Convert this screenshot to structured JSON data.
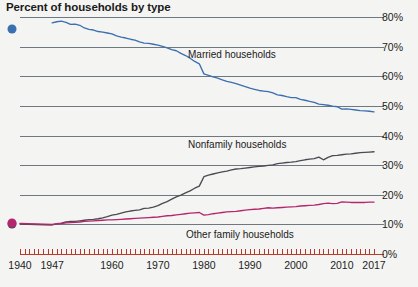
{
  "header": {
    "title": "Percent of households by type"
  },
  "axes": {
    "y_ticks": [
      "80%",
      "70%",
      "60%",
      "50%",
      "40%",
      "30%",
      "20%",
      "10%",
      "0%"
    ],
    "y_values": [
      80,
      70,
      60,
      50,
      40,
      30,
      20,
      10,
      0
    ],
    "x_ticks": [
      "1940",
      "1947",
      "1960",
      "1970",
      "1980",
      "1990",
      "2000",
      "2010",
      "2017"
    ],
    "x_values": [
      1940,
      1947,
      1960,
      1970,
      1980,
      1990,
      2000,
      2010,
      2017
    ]
  },
  "annotations": {
    "married_label": "Married households",
    "nonfamily_label": "Nonfamily households",
    "other_family_label": "Other family households"
  },
  "colors": {
    "married": "#3a6fb0",
    "nonfamily": "#4a4a52",
    "other_family": "#b5266e",
    "gridline": "#6f7780",
    "baseline": "#c0392b",
    "background": "#f4f4f2",
    "text": "#1a1a1a"
  },
  "chart_data": {
    "type": "line",
    "title": "Percent of households by type",
    "xlabel": "",
    "ylabel": "",
    "xlim": [
      1940,
      2017
    ],
    "ylim": [
      0,
      80
    ],
    "grid": true,
    "legend_position": "inline-annotations",
    "series": [
      {
        "name": "Married households",
        "color": "#3a6fb0",
        "start_dot": {
          "x": 1940,
          "y": 76.0
        },
        "points": [
          [
            1947,
            78.0
          ],
          [
            1948,
            78.4
          ],
          [
            1949,
            78.6
          ],
          [
            1950,
            78.2
          ],
          [
            1951,
            77.5
          ],
          [
            1952,
            77.6
          ],
          [
            1953,
            77.2
          ],
          [
            1954,
            76.3
          ],
          [
            1955,
            75.8
          ],
          [
            1956,
            75.6
          ],
          [
            1957,
            75.1
          ],
          [
            1958,
            74.9
          ],
          [
            1959,
            74.6
          ],
          [
            1960,
            74.3
          ],
          [
            1961,
            73.6
          ],
          [
            1962,
            73.2
          ],
          [
            1963,
            72.9
          ],
          [
            1964,
            72.5
          ],
          [
            1965,
            72.2
          ],
          [
            1966,
            71.6
          ],
          [
            1967,
            71.2
          ],
          [
            1968,
            71.1
          ],
          [
            1969,
            70.8
          ],
          [
            1970,
            70.5
          ],
          [
            1971,
            70.1
          ],
          [
            1972,
            69.6
          ],
          [
            1973,
            69.0
          ],
          [
            1974,
            68.6
          ],
          [
            1975,
            67.7
          ],
          [
            1976,
            67.0
          ],
          [
            1977,
            66.1
          ],
          [
            1978,
            65.0
          ],
          [
            1979,
            64.2
          ],
          [
            1980,
            60.8
          ],
          [
            1981,
            60.3
          ],
          [
            1982,
            59.8
          ],
          [
            1983,
            59.4
          ],
          [
            1984,
            58.8
          ],
          [
            1985,
            58.3
          ],
          [
            1986,
            57.9
          ],
          [
            1987,
            57.5
          ],
          [
            1988,
            57.0
          ],
          [
            1989,
            56.5
          ],
          [
            1990,
            56.0
          ],
          [
            1991,
            55.6
          ],
          [
            1992,
            55.2
          ],
          [
            1993,
            55.0
          ],
          [
            1994,
            54.8
          ],
          [
            1995,
            54.4
          ],
          [
            1996,
            53.7
          ],
          [
            1997,
            53.5
          ],
          [
            1998,
            53.1
          ],
          [
            1999,
            52.8
          ],
          [
            2000,
            52.8
          ],
          [
            2001,
            52.2
          ],
          [
            2002,
            51.9
          ],
          [
            2003,
            51.5
          ],
          [
            2004,
            51.2
          ],
          [
            2005,
            50.6
          ],
          [
            2006,
            50.4
          ],
          [
            2007,
            50.2
          ],
          [
            2008,
            49.9
          ],
          [
            2009,
            49.7
          ],
          [
            2010,
            48.9
          ],
          [
            2011,
            49.0
          ],
          [
            2012,
            48.8
          ],
          [
            2013,
            48.6
          ],
          [
            2014,
            48.4
          ],
          [
            2015,
            48.3
          ],
          [
            2016,
            48.2
          ],
          [
            2017,
            48.0
          ]
        ]
      },
      {
        "name": "Nonfamily households",
        "color": "#4a4a52",
        "start_dot": {
          "x": 1940,
          "y": 10.0
        },
        "points": [
          [
            1940,
            10.1
          ],
          [
            1947,
            9.8
          ],
          [
            1948,
            10.2
          ],
          [
            1949,
            10.4
          ],
          [
            1950,
            10.8
          ],
          [
            1951,
            11.0
          ],
          [
            1952,
            11.0
          ],
          [
            1953,
            11.2
          ],
          [
            1954,
            11.4
          ],
          [
            1955,
            11.6
          ],
          [
            1956,
            11.7
          ],
          [
            1957,
            11.9
          ],
          [
            1958,
            12.2
          ],
          [
            1959,
            12.6
          ],
          [
            1960,
            13.1
          ],
          [
            1961,
            13.4
          ],
          [
            1962,
            13.8
          ],
          [
            1963,
            14.2
          ],
          [
            1964,
            14.5
          ],
          [
            1965,
            14.7
          ],
          [
            1966,
            14.9
          ],
          [
            1967,
            15.4
          ],
          [
            1968,
            15.5
          ],
          [
            1969,
            15.8
          ],
          [
            1970,
            16.3
          ],
          [
            1971,
            17.1
          ],
          [
            1972,
            17.7
          ],
          [
            1973,
            18.5
          ],
          [
            1974,
            19.3
          ],
          [
            1975,
            19.9
          ],
          [
            1976,
            20.6
          ],
          [
            1977,
            21.3
          ],
          [
            1978,
            22.2
          ],
          [
            1979,
            22.9
          ],
          [
            1980,
            26.1
          ],
          [
            1981,
            26.6
          ],
          [
            1982,
            27.0
          ],
          [
            1983,
            27.4
          ],
          [
            1984,
            27.7
          ],
          [
            1985,
            28.0
          ],
          [
            1986,
            28.4
          ],
          [
            1987,
            28.7
          ],
          [
            1988,
            28.8
          ],
          [
            1989,
            29.0
          ],
          [
            1990,
            29.2
          ],
          [
            1991,
            29.4
          ],
          [
            1992,
            29.6
          ],
          [
            1993,
            29.7
          ],
          [
            1994,
            29.9
          ],
          [
            1995,
            30.1
          ],
          [
            1996,
            30.5
          ],
          [
            1997,
            30.7
          ],
          [
            1998,
            30.9
          ],
          [
            1999,
            31.0
          ],
          [
            2000,
            31.2
          ],
          [
            2001,
            31.5
          ],
          [
            2002,
            31.8
          ],
          [
            2003,
            32.0
          ],
          [
            2004,
            32.2
          ],
          [
            2005,
            32.7
          ],
          [
            2006,
            31.8
          ],
          [
            2007,
            32.6
          ],
          [
            2008,
            33.2
          ],
          [
            2009,
            33.3
          ],
          [
            2010,
            33.5
          ],
          [
            2011,
            33.7
          ],
          [
            2012,
            33.8
          ],
          [
            2013,
            34.0
          ],
          [
            2014,
            34.2
          ],
          [
            2015,
            34.3
          ],
          [
            2016,
            34.4
          ],
          [
            2017,
            34.5
          ]
        ]
      },
      {
        "name": "Other family households",
        "color": "#b5266e",
        "start_dot": {
          "x": 1940,
          "y": 10.3
        },
        "points": [
          [
            1940,
            10.3
          ],
          [
            1947,
            10.0
          ],
          [
            1948,
            10.2
          ],
          [
            1949,
            10.3
          ],
          [
            1950,
            10.5
          ],
          [
            1951,
            10.6
          ],
          [
            1952,
            10.7
          ],
          [
            1953,
            10.8
          ],
          [
            1954,
            11.0
          ],
          [
            1955,
            11.1
          ],
          [
            1956,
            11.2
          ],
          [
            1957,
            11.3
          ],
          [
            1958,
            11.4
          ],
          [
            1959,
            11.5
          ],
          [
            1960,
            11.5
          ],
          [
            1961,
            11.6
          ],
          [
            1962,
            11.7
          ],
          [
            1963,
            11.8
          ],
          [
            1964,
            11.9
          ],
          [
            1965,
            12.0
          ],
          [
            1966,
            12.1
          ],
          [
            1967,
            12.2
          ],
          [
            1968,
            12.3
          ],
          [
            1969,
            12.4
          ],
          [
            1970,
            12.5
          ],
          [
            1971,
            12.7
          ],
          [
            1972,
            12.9
          ],
          [
            1973,
            13.0
          ],
          [
            1974,
            13.2
          ],
          [
            1975,
            13.4
          ],
          [
            1976,
            13.6
          ],
          [
            1977,
            13.8
          ],
          [
            1978,
            13.9
          ],
          [
            1979,
            14.0
          ],
          [
            1980,
            13.1
          ],
          [
            1981,
            13.3
          ],
          [
            1982,
            13.6
          ],
          [
            1983,
            13.8
          ],
          [
            1984,
            14.0
          ],
          [
            1985,
            14.2
          ],
          [
            1986,
            14.3
          ],
          [
            1987,
            14.4
          ],
          [
            1988,
            14.6
          ],
          [
            1989,
            14.8
          ],
          [
            1990,
            15.0
          ],
          [
            1991,
            15.1
          ],
          [
            1992,
            15.2
          ],
          [
            1993,
            15.4
          ],
          [
            1994,
            15.6
          ],
          [
            1995,
            15.5
          ],
          [
            1996,
            15.6
          ],
          [
            1997,
            15.7
          ],
          [
            1998,
            15.8
          ],
          [
            1999,
            15.9
          ],
          [
            2000,
            16.0
          ],
          [
            2001,
            16.2
          ],
          [
            2002,
            16.3
          ],
          [
            2003,
            16.4
          ],
          [
            2004,
            16.5
          ],
          [
            2005,
            16.7
          ],
          [
            2006,
            17.0
          ],
          [
            2007,
            17.2
          ],
          [
            2008,
            17.0
          ],
          [
            2009,
            17.1
          ],
          [
            2010,
            17.6
          ],
          [
            2011,
            17.5
          ],
          [
            2012,
            17.4
          ],
          [
            2013,
            17.4
          ],
          [
            2014,
            17.4
          ],
          [
            2015,
            17.4
          ],
          [
            2016,
            17.5
          ],
          [
            2017,
            17.5
          ]
        ]
      }
    ]
  }
}
